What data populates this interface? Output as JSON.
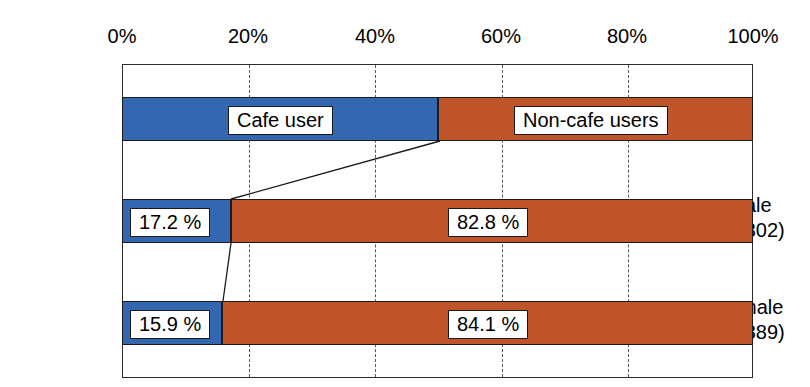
{
  "chart_data": {
    "type": "bar",
    "subtype": "stacked-horizontal-100-percent",
    "title": "",
    "xlabel": "",
    "ylabel": "",
    "xlim": [
      0,
      100
    ],
    "grid": true,
    "legend_position": "top-bar",
    "axis_ticks": [
      {
        "value": 0,
        "label": "0%"
      },
      {
        "value": 20,
        "label": "20%"
      },
      {
        "value": 40,
        "label": "40%"
      },
      {
        "value": 60,
        "label": "60%"
      },
      {
        "value": 80,
        "label": "80%"
      },
      {
        "value": 100,
        "label": "100%"
      }
    ],
    "series": [
      {
        "name": "Cafe user",
        "color": "#3567b0",
        "values": [
          50.0,
          17.2,
          15.9
        ]
      },
      {
        "name": "Non-cafe users",
        "color": "#c0552b",
        "values": [
          50.0,
          82.8,
          84.1
        ]
      }
    ],
    "categories": [
      "legend",
      "male\n(n=302)",
      "Female\n(n=889)"
    ],
    "rows": [
      {
        "id": "legend",
        "is_legend": true,
        "label_line1": "",
        "label_line2": "",
        "segments": [
          {
            "series": "Cafe user",
            "value": 50.0,
            "color": "#3567b0",
            "label": "Cafe user"
          },
          {
            "series": "Non-cafe users",
            "value": 50.0,
            "color": "#c0552b",
            "label": "Non-cafe users"
          }
        ]
      },
      {
        "id": "male",
        "is_legend": false,
        "label_line1": "male",
        "label_line2": "(n=302)",
        "n": 302,
        "segments": [
          {
            "series": "Cafe user",
            "value": 17.2,
            "color": "#3567b0",
            "label": "17.2 %"
          },
          {
            "series": "Non-cafe users",
            "value": 82.8,
            "color": "#c0552b",
            "label": "82.8 %"
          }
        ]
      },
      {
        "id": "female",
        "is_legend": false,
        "label_line1": "Female",
        "label_line2": "(n=889)",
        "n": 889,
        "segments": [
          {
            "series": "Cafe user",
            "value": 15.9,
            "color": "#3567b0",
            "label": "15.9 %"
          },
          {
            "series": "Non-cafe users",
            "value": 84.1,
            "color": "#c0552b",
            "label": "84.1 %"
          }
        ]
      }
    ],
    "colors": {
      "cafe_user": "#3567b0",
      "non_cafe_users": "#c0552b",
      "frame": "#2b2b2b",
      "gridline": "#555555",
      "background": "#ffffff",
      "text": "#000000"
    }
  }
}
